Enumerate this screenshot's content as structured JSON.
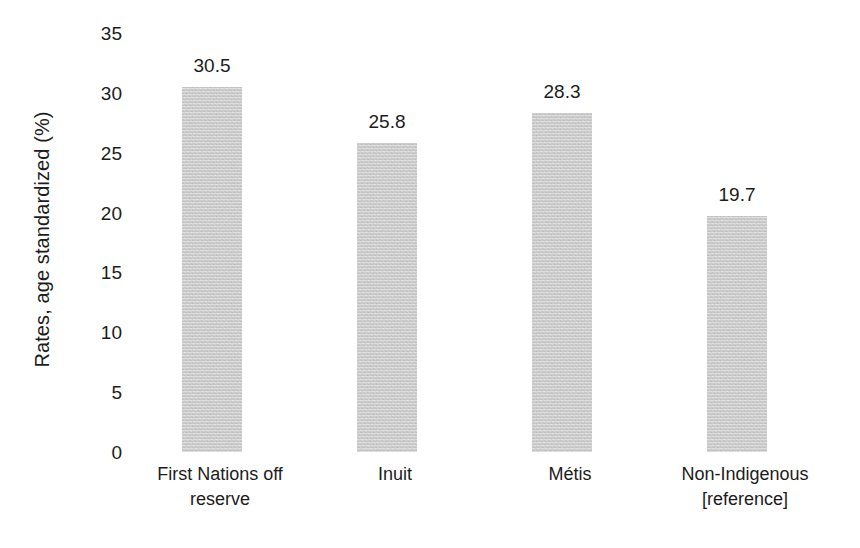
{
  "chart_data": {
    "type": "bar",
    "title": "",
    "subtitle": "",
    "xlabel": "",
    "ylabel": "Rates, age standardized (%)",
    "categories": [
      "First Nations off reserve",
      "Inuit",
      "Métis",
      "Non-Indigenous [reference]"
    ],
    "category_lines": [
      [
        "First Nations off",
        "reserve"
      ],
      [
        "Inuit",
        ""
      ],
      [
        "Métis",
        ""
      ],
      [
        "Non-Indigenous",
        "[reference]"
      ]
    ],
    "values": [
      30.5,
      25.8,
      28.3,
      19.7
    ],
    "value_labels": [
      "30.5",
      "25.8",
      "28.3",
      "19.7"
    ],
    "ylim": [
      0,
      35
    ],
    "yticks": [
      0,
      5,
      10,
      15,
      20,
      25,
      30,
      35
    ],
    "ytick_labels": [
      "0",
      "5",
      "10",
      "15",
      "20",
      "25",
      "30",
      "35"
    ],
    "grid": false,
    "legend": null,
    "legend_position": "none",
    "bar_color": "#c9c9c9",
    "text_color": "#1c1c1c",
    "background_color": "#ffffff"
  }
}
